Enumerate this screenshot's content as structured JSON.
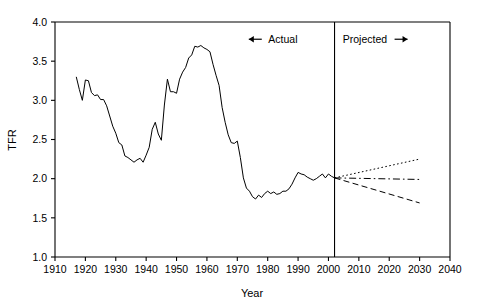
{
  "chart_data": {
    "type": "line",
    "title": "",
    "xlabel": "Year",
    "ylabel": "TFR",
    "xlim": [
      1910,
      2040
    ],
    "ylim": [
      1.0,
      4.0
    ],
    "grid": false,
    "legend": null,
    "xticks": [
      1910,
      1920,
      1930,
      1940,
      1950,
      1960,
      1970,
      1980,
      1990,
      2000,
      2010,
      2020,
      2030,
      2040
    ],
    "xtick_labels": [
      "1910",
      "1920",
      "1930",
      "1940",
      "1950",
      "1960",
      "1970",
      "1980",
      "1990",
      "2000",
      "2010",
      "2020",
      "2030",
      "2040"
    ],
    "yticks": [
      1.0,
      1.5,
      2.0,
      2.5,
      3.0,
      3.5,
      4.0
    ],
    "ytick_labels": [
      "1.0",
      "1.5",
      "2.0",
      "2.5",
      "3.0",
      "3.5",
      "4.0"
    ],
    "annotations": [
      {
        "name": "actual-label",
        "text": "Actual",
        "arrow": "left",
        "x": 1985,
        "y": 3.78
      },
      {
        "name": "projected-label",
        "text": "Projected",
        "arrow": "right",
        "x": 2012,
        "y": 3.78
      },
      {
        "name": "divider",
        "text": "",
        "x": 2002,
        "y": null
      }
    ],
    "divider_year": 2002,
    "series": [
      {
        "name": "Actual TFR",
        "style": "solid",
        "x": [
          1917,
          1918,
          1919,
          1920,
          1921,
          1922,
          1923,
          1924,
          1925,
          1926,
          1927,
          1928,
          1929,
          1930,
          1931,
          1932,
          1933,
          1934,
          1935,
          1936,
          1937,
          1938,
          1939,
          1940,
          1941,
          1942,
          1943,
          1944,
          1945,
          1946,
          1947,
          1948,
          1949,
          1950,
          1951,
          1952,
          1953,
          1954,
          1955,
          1956,
          1957,
          1958,
          1959,
          1960,
          1961,
          1962,
          1963,
          1964,
          1965,
          1966,
          1967,
          1968,
          1969,
          1970,
          1971,
          1972,
          1973,
          1974,
          1975,
          1976,
          1977,
          1978,
          1979,
          1980,
          1981,
          1982,
          1983,
          1984,
          1985,
          1986,
          1987,
          1988,
          1989,
          1990,
          1991,
          1992,
          1993,
          1994,
          1995,
          1996,
          1997,
          1998,
          1999,
          2000,
          2001,
          2002
        ],
        "values": [
          3.3,
          3.14,
          3.0,
          3.26,
          3.25,
          3.1,
          3.06,
          3.07,
          3.01,
          3.01,
          2.93,
          2.8,
          2.67,
          2.58,
          2.46,
          2.43,
          2.29,
          2.27,
          2.24,
          2.21,
          2.24,
          2.26,
          2.21,
          2.3,
          2.4,
          2.63,
          2.72,
          2.57,
          2.49,
          2.94,
          3.27,
          3.11,
          3.11,
          3.09,
          3.27,
          3.36,
          3.42,
          3.54,
          3.58,
          3.69,
          3.68,
          3.7,
          3.67,
          3.65,
          3.62,
          3.46,
          3.32,
          3.19,
          2.91,
          2.72,
          2.56,
          2.46,
          2.45,
          2.48,
          2.27,
          2.01,
          1.88,
          1.84,
          1.77,
          1.74,
          1.79,
          1.76,
          1.81,
          1.84,
          1.81,
          1.83,
          1.8,
          1.81,
          1.84,
          1.84,
          1.87,
          1.93,
          2.01,
          2.08,
          2.06,
          2.05,
          2.02,
          2.0,
          1.98,
          2.0,
          2.03,
          2.06,
          2.01,
          2.06,
          2.03,
          2.01
        ]
      },
      {
        "name": "High projection",
        "style": "dotted",
        "x": [
          2002,
          2030
        ],
        "values": [
          2.01,
          2.25
        ]
      },
      {
        "name": "Middle projection",
        "style": "dashdot",
        "x": [
          2002,
          2030
        ],
        "values": [
          2.01,
          1.99
        ]
      },
      {
        "name": "Low projection",
        "style": "dashed",
        "x": [
          2002,
          2030
        ],
        "values": [
          2.01,
          1.69
        ]
      }
    ]
  },
  "colors": {
    "axis": "#000000",
    "line": "#000000",
    "background": "#ffffff"
  }
}
